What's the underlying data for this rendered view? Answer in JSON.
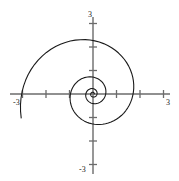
{
  "chart_data": {
    "type": "line",
    "title": "",
    "subtitle": "",
    "xlabel": "",
    "ylabel": "",
    "xlim": [
      -3,
      3
    ],
    "ylim": [
      -3,
      3
    ],
    "grid": false,
    "legend": null,
    "coordinate_system": "polar",
    "axis_labels": {
      "y_top": "3",
      "y_bottom": "-3",
      "x_left": "-3",
      "x_right": "3"
    },
    "x_ticks": [
      -3,
      -2,
      -1,
      0,
      1,
      2,
      3
    ],
    "y_ticks": [
      -3,
      -2,
      -1,
      0,
      1,
      2,
      3
    ],
    "x_tick_labels": [
      "-3",
      "",
      "",
      "",
      "",
      "",
      "3"
    ],
    "y_tick_labels": [
      "-3",
      "",
      "",
      "",
      "",
      "",
      "3"
    ],
    "series": [
      {
        "name": "logarithmic-spiral",
        "equation": "r = a*e^(b*theta)",
        "a": 0.055,
        "b": 0.185,
        "theta_start": 0.0,
        "theta_end": 21.99,
        "theta_step": 0.0875,
        "color": "#1a1a1a",
        "linewidth": 1.1,
        "turns": 3.5,
        "polar_samples_r": [
          0.055,
          0.0559,
          0.0568,
          0.0577,
          0.0586,
          0.0595,
          0.0605,
          0.0614,
          0.0624,
          0.0634,
          0.0644,
          0.0654,
          0.0665,
          0.0675,
          0.0686,
          0.0697,
          0.0708,
          0.0719,
          0.0731,
          0.0742,
          0.0754,
          0.0766,
          0.0778,
          0.0791,
          0.0803,
          0.0816,
          0.0829,
          0.0842,
          0.0856,
          0.0869,
          0.0883,
          0.0897,
          0.0911,
          0.0926,
          0.0941,
          0.0956,
          0.0971,
          0.0986,
          0.1002,
          0.1018,
          0.1034,
          0.1051,
          0.1068,
          0.1085,
          0.1102,
          0.112,
          0.1138,
          0.1156,
          0.1174,
          0.1193,
          0.1212,
          0.1232,
          0.1252,
          0.1272,
          0.1292,
          0.1313,
          0.1334,
          0.1356,
          0.1378,
          0.14,
          0.1422,
          0.1445,
          0.1468,
          0.1492,
          0.1516,
          0.154,
          0.1565,
          0.159,
          0.1616,
          0.1642,
          0.1668,
          0.1695,
          0.1722,
          0.175,
          0.1778,
          0.1807,
          0.1836,
          0.1865,
          0.1895,
          0.1926,
          0.1957,
          0.1988,
          0.202,
          0.2053,
          0.2086,
          0.212,
          0.2154,
          0.2189,
          0.2224,
          0.226,
          0.2296,
          0.2333,
          0.2371,
          0.2409,
          0.2448,
          0.2487,
          0.2527,
          0.2568,
          0.2609,
          0.2651,
          0.2694,
          0.2737,
          0.2781,
          0.2826,
          0.2871,
          0.2917,
          0.2964,
          0.3012,
          0.306,
          0.311,
          0.316,
          0.321,
          0.3262,
          0.3314,
          0.3368,
          0.3422,
          0.3477,
          0.3533,
          0.359,
          0.3647,
          0.3706,
          0.3766,
          0.3826,
          0.3888,
          0.395,
          0.4014,
          0.4078,
          0.4144,
          0.4211,
          0.4278,
          0.4347,
          0.4417,
          0.4488,
          0.456,
          0.4634,
          0.4708,
          0.4784,
          0.4861,
          0.4939,
          0.5019,
          0.5099,
          0.5181,
          0.5265,
          0.535,
          0.5436,
          0.5523,
          0.5612,
          0.5702,
          0.5794,
          0.5887,
          0.5982,
          0.6078,
          0.6176,
          0.6275,
          0.6376,
          0.6479,
          0.6583,
          0.6689,
          0.6797,
          0.6906,
          0.7017,
          0.713,
          0.7245,
          0.7362,
          0.7481,
          0.7601,
          0.7724,
          0.7848,
          0.7975,
          0.8104,
          0.8235,
          0.8368,
          0.8503,
          0.864,
          0.878,
          0.8922,
          0.9066,
          0.9213,
          0.9362,
          0.9513,
          0.9667,
          0.9823,
          0.9982,
          1.0143,
          1.0307,
          1.0474,
          1.0643,
          1.0815,
          1.099,
          1.1168,
          1.1348,
          1.1532,
          1.1718,
          1.1908,
          1.21,
          1.2296,
          1.2495,
          1.2697,
          1.2902,
          1.3111,
          1.3323,
          1.3538,
          1.3757,
          1.398,
          1.4206,
          1.4436,
          1.4669,
          1.4906,
          1.5147,
          1.5392,
          1.5641,
          1.5894,
          1.6151,
          1.6412,
          1.6677,
          1.6947,
          1.7221,
          1.75,
          1.7783,
          1.8071,
          1.8363,
          1.866,
          1.8962,
          1.9269,
          1.9581,
          1.9897,
          2.0219,
          2.0546,
          2.0879,
          2.1217,
          2.156,
          2.1909,
          2.2263,
          2.2624,
          2.299,
          2.3362,
          2.374,
          2.4124,
          2.4514,
          2.4911,
          2.5314,
          2.5724,
          2.614,
          2.6563,
          2.6993,
          2.743,
          2.7874,
          2.8325,
          2.8783,
          2.9249,
          2.9722,
          3.0203,
          3.0692,
          3.1189,
          3.1693,
          3.2206
        ]
      }
    ]
  },
  "axes": {
    "origin_px": [
      93,
      94
    ],
    "scale_px_per_unit": 23.5,
    "axis_color": "#6b6b6b",
    "tick_color": "#6b6b6b",
    "curve_color": "#1a1a1a",
    "background": "#ffffff"
  }
}
